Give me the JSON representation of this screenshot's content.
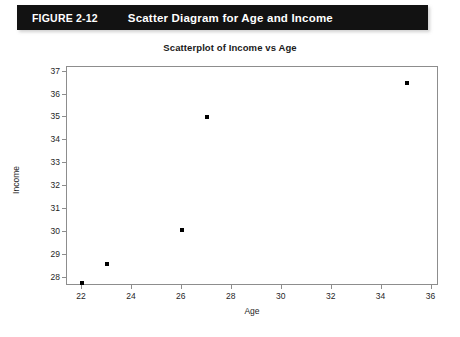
{
  "figure": {
    "number": "FIGURE 2-12",
    "caption": "Scatter Diagram for Age and Income"
  },
  "chart_data": {
    "type": "scatter",
    "title": "Scatterplot of Income vs Age",
    "xlabel": "Age",
    "ylabel": "Income",
    "xlim": [
      21.4,
      36.3
    ],
    "ylim": [
      27.65,
      37.2
    ],
    "xticks": [
      22,
      24,
      26,
      28,
      30,
      32,
      34,
      36
    ],
    "yticks": [
      28,
      29,
      30,
      31,
      32,
      33,
      34,
      35,
      36,
      37
    ],
    "grid": false,
    "legend": null,
    "marker": "square",
    "marker_color": "#000000",
    "x": [
      22,
      23,
      26,
      27,
      35
    ],
    "y": [
      27.8,
      28.6,
      30.1,
      35.0,
      36.5
    ],
    "points": [
      {
        "x": 22,
        "y": 27.8
      },
      {
        "x": 23,
        "y": 28.6
      },
      {
        "x": 26,
        "y": 30.1
      },
      {
        "x": 27,
        "y": 35.0
      },
      {
        "x": 35,
        "y": 36.5
      }
    ]
  }
}
